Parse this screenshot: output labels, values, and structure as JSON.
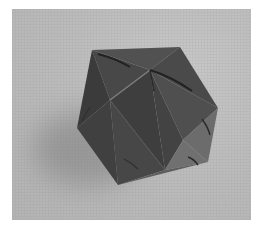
{
  "image": {
    "subject": "origami icosahedron",
    "description": "Grayscale photograph of a folded paper icosahedron resting on a light surface with a soft shadow to the lower left",
    "colors": {
      "background": "#ffffff",
      "surface": "#bfbfbf",
      "shadow": "#8e8e8e",
      "face_dark": "#3f3f3f",
      "face_mid": "#555555",
      "face_light": "#6e6e6e",
      "crease": "#262626",
      "highlight": "#8a8a8a"
    }
  }
}
